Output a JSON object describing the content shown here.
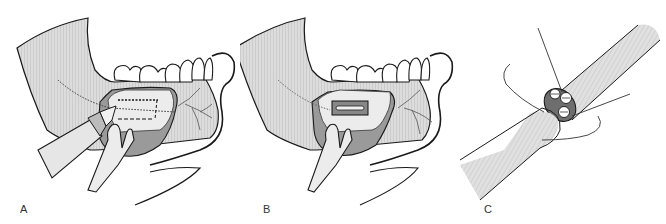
{
  "figure": {
    "colors": {
      "line": "#1a1a1a",
      "bone_fill": "#d4d4d4",
      "bone_hatch": "#bdbdbd",
      "soft_tissue": "#9a9a9a",
      "window_fill": "#ececec",
      "tooth_fill": "#ffffff",
      "nerve_cross_section": "#6e6e6e"
    },
    "panels": [
      {
        "id": "A",
        "label": "A",
        "content": "Lateral mandible with mucoperiosteal flap retracted; bur outlining rectangular cortical window (dotted/dashed outline) over inferior alveolar canal"
      },
      {
        "id": "B",
        "label": "B",
        "content": "Cortical bone window removed exposing inferior alveolar nerve within canal"
      },
      {
        "id": "C",
        "label": "C",
        "content": "Epineurial nerve repair: two nerve stumps with fascicular cross-section and sutures"
      }
    ]
  }
}
